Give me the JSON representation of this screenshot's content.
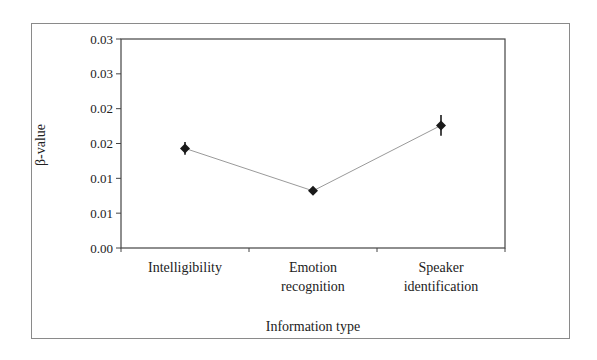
{
  "chart_data": {
    "type": "line",
    "title": "",
    "xlabel": "Information type",
    "ylabel": "β-value",
    "categories": [
      "Intelligibility",
      "Emotion recognition",
      "Speaker identification"
    ],
    "category_lines": [
      [
        "Intelligibility"
      ],
      [
        "Emotion",
        "recognition"
      ],
      [
        "Speaker",
        "identification"
      ]
    ],
    "series": [
      {
        "name": "β-value",
        "values": [
          0.0143,
          0.0082,
          0.0176
        ],
        "error": [
          0.0009,
          0.0003,
          0.0015
        ],
        "marker": "diamond",
        "line_color": "#9a9a9a",
        "marker_color": "#1a1a1a"
      }
    ],
    "ylim": [
      0,
      0.03
    ],
    "yticks": [
      0,
      0.005,
      0.01,
      0.015,
      0.02,
      0.025,
      0.03
    ],
    "ytick_labels": [
      "0.00",
      "0.01",
      "0.01",
      "0.02",
      "0.02",
      "0.03",
      "0.03"
    ],
    "grid": false,
    "legend": null
  }
}
